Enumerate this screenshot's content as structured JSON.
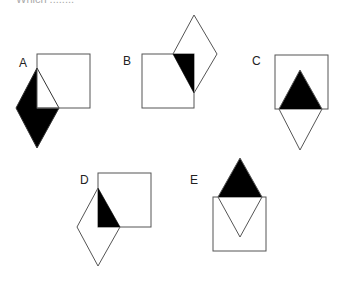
{
  "header": {
    "clipped_text": "Which ........"
  },
  "figures": [
    {
      "label": "A"
    },
    {
      "label": "B"
    },
    {
      "label": "C"
    },
    {
      "label": "D"
    },
    {
      "label": "E"
    }
  ],
  "colors": {
    "stroke": "#555555",
    "fill": "#000000",
    "background": "#ffffff"
  }
}
